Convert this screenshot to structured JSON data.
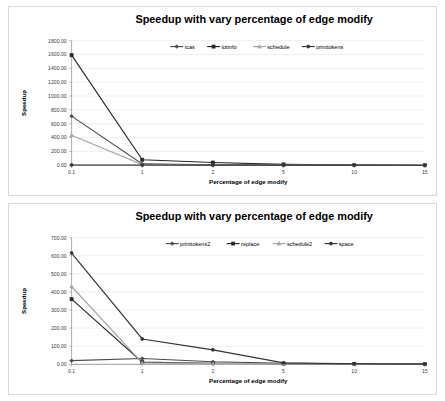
{
  "page": {
    "background": "#ffffff",
    "card_border_color": "#d9d9d9"
  },
  "charts": [
    {
      "id": "chart-top",
      "name": "speedup-chart-top",
      "chart_data": {
        "type": "line",
        "title": "Speedup with vary percentage of edge modify",
        "xlabel": "Percentage of edge modify",
        "ylabel": "Speedup",
        "categories": [
          "0.1",
          "1",
          "2",
          "5",
          "10",
          "15"
        ],
        "ylim": [
          0,
          1800
        ],
        "ytick_step": 200,
        "ytick_labels": [
          "0.00",
          "200.00",
          "400.00",
          "600.00",
          "800.00",
          "1000.00",
          "1200.00",
          "1400.00",
          "1600.00",
          "1800.00"
        ],
        "grid": true,
        "legend_position": "top-center",
        "series": [
          {
            "name": "tcas",
            "color": "#4a4a4a",
            "marker": "diamond",
            "values": [
              710,
              20,
              8,
              4,
              2,
              1
            ]
          },
          {
            "name": "totinfo",
            "color": "#262626",
            "marker": "square",
            "values": [
              1590,
              80,
              40,
              14,
              3,
              1
            ]
          },
          {
            "name": "schedule",
            "color": "#a6a6a6",
            "marker": "triangle",
            "values": [
              435,
              10,
              5,
              3,
              2,
              1
            ]
          },
          {
            "name": "printtokens",
            "color": "#333333",
            "marker": "circle",
            "values": [
              5,
              4,
              3,
              3,
              2,
              1
            ]
          }
        ]
      }
    },
    {
      "id": "chart-bottom",
      "name": "speedup-chart-bottom",
      "chart_data": {
        "type": "line",
        "title": "Speedup with vary percentage of edge modify",
        "xlabel": "Percentage of edge modify",
        "ylabel": "Speedup",
        "categories": [
          "0.1",
          "1",
          "2",
          "5",
          "10",
          "15"
        ],
        "ylim": [
          0,
          700
        ],
        "ytick_step": 100,
        "ytick_labels": [
          "0.00",
          "100.00",
          "200.00",
          "300.00",
          "400.00",
          "500.00",
          "600.00",
          "700.00"
        ],
        "grid": true,
        "legend_position": "top-center",
        "series": [
          {
            "name": "printtokens2",
            "color": "#4a4a4a",
            "marker": "diamond",
            "values": [
              20,
              32,
              14,
              6,
              3,
              1
            ]
          },
          {
            "name": "replace",
            "color": "#262626",
            "marker": "square",
            "values": [
              360,
              12,
              6,
              4,
              2,
              1
            ]
          },
          {
            "name": "schedule2",
            "color": "#a6a6a6",
            "marker": "triangle",
            "values": [
              430,
              8,
              5,
              3,
              2,
              1
            ]
          },
          {
            "name": "space",
            "color": "#333333",
            "marker": "circle",
            "values": [
              615,
              140,
              80,
              8,
              3,
              1
            ]
          }
        ]
      }
    }
  ]
}
